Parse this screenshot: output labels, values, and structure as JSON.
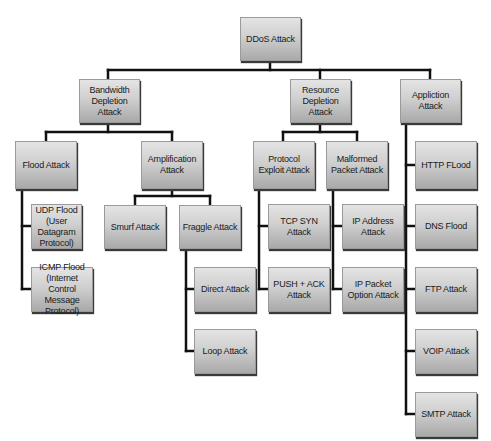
{
  "diagram": {
    "type": "tree",
    "title": "DDoS Attack",
    "colors": {
      "line": "#111111",
      "box_top": "#e4e4e4",
      "box_bottom": "#a9a9a9",
      "text": "#1a1a1a"
    },
    "nodes": {
      "root": {
        "label": "DDoS Attack",
        "x": 240,
        "y": 17,
        "w": 61,
        "h": 44
      },
      "bandwidth": {
        "label": "Bandwidth Depletion Attack",
        "x": 79,
        "y": 79,
        "w": 61,
        "h": 44
      },
      "resource": {
        "label": "Resource Depletion Attack",
        "x": 290,
        "y": 79,
        "w": 61,
        "h": 44
      },
      "application": {
        "label": "Appliction Attack",
        "x": 400,
        "y": 79,
        "w": 61,
        "h": 44
      },
      "flood": {
        "label": "Flood Attack",
        "x": 15,
        "y": 141,
        "w": 62,
        "h": 48
      },
      "amplification": {
        "label": "Amplification Attack",
        "x": 141,
        "y": 141,
        "w": 62,
        "h": 48
      },
      "protocol_exploit": {
        "label": "Protocol Exploit Attack",
        "x": 253,
        "y": 141,
        "w": 62,
        "h": 48
      },
      "malformed": {
        "label": "Malformed Packet Attack",
        "x": 326,
        "y": 141,
        "w": 62,
        "h": 48
      },
      "http": {
        "label": "HTTP FLood",
        "x": 415,
        "y": 141,
        "w": 62,
        "h": 48
      },
      "udp": {
        "label": "UDP Flood (User Datagram Protocol)",
        "x": 31,
        "y": 204,
        "w": 51,
        "h": 45
      },
      "icmp": {
        "label": "ICMP Flood (Internet Control Message Protocol)",
        "x": 31,
        "y": 267,
        "w": 62,
        "h": 45
      },
      "smurf": {
        "label": "Smurf Attack",
        "x": 104,
        "y": 205,
        "w": 62,
        "h": 44
      },
      "fraggle": {
        "label": "Fraggle Attack",
        "x": 179,
        "y": 205,
        "w": 62,
        "h": 44
      },
      "tcp_syn": {
        "label": "TCP SYN Attack",
        "x": 268,
        "y": 204,
        "w": 62,
        "h": 45
      },
      "ip_address": {
        "label": "IP Address Attack",
        "x": 342,
        "y": 204,
        "w": 62,
        "h": 45
      },
      "dns": {
        "label": "DNS Flood",
        "x": 415,
        "y": 204,
        "w": 62,
        "h": 45
      },
      "direct": {
        "label": "Direct Attack",
        "x": 194,
        "y": 267,
        "w": 62,
        "h": 45
      },
      "push_ack": {
        "label": "PUSH + ACK Attack",
        "x": 268,
        "y": 267,
        "w": 62,
        "h": 45
      },
      "ip_packet_option": {
        "label": "IP Packet Option Attack",
        "x": 342,
        "y": 267,
        "w": 62,
        "h": 45
      },
      "ftp": {
        "label": "FTP Attack",
        "x": 415,
        "y": 267,
        "w": 62,
        "h": 45
      },
      "loop": {
        "label": "Loop Attack",
        "x": 194,
        "y": 329,
        "w": 62,
        "h": 45
      },
      "voip": {
        "label": "VOIP Attack",
        "x": 415,
        "y": 329,
        "w": 62,
        "h": 45
      },
      "smtp": {
        "label": "SMTP Attack",
        "x": 415,
        "y": 392,
        "w": 62,
        "h": 45
      }
    },
    "edges": [
      [
        "root",
        "bandwidth"
      ],
      [
        "root",
        "resource"
      ],
      [
        "root",
        "application"
      ],
      [
        "bandwidth",
        "flood"
      ],
      [
        "bandwidth",
        "amplification"
      ],
      [
        "resource",
        "protocol_exploit"
      ],
      [
        "resource",
        "malformed"
      ],
      [
        "application",
        "http"
      ],
      [
        "application",
        "dns"
      ],
      [
        "application",
        "ftp"
      ],
      [
        "application",
        "voip"
      ],
      [
        "application",
        "smtp"
      ],
      [
        "flood",
        "udp"
      ],
      [
        "flood",
        "icmp"
      ],
      [
        "amplification",
        "smurf"
      ],
      [
        "amplification",
        "fraggle"
      ],
      [
        "fraggle",
        "direct"
      ],
      [
        "fraggle",
        "loop"
      ],
      [
        "protocol_exploit",
        "tcp_syn"
      ],
      [
        "protocol_exploit",
        "push_ack"
      ],
      [
        "malformed",
        "ip_address"
      ],
      [
        "malformed",
        "ip_packet_option"
      ]
    ]
  }
}
